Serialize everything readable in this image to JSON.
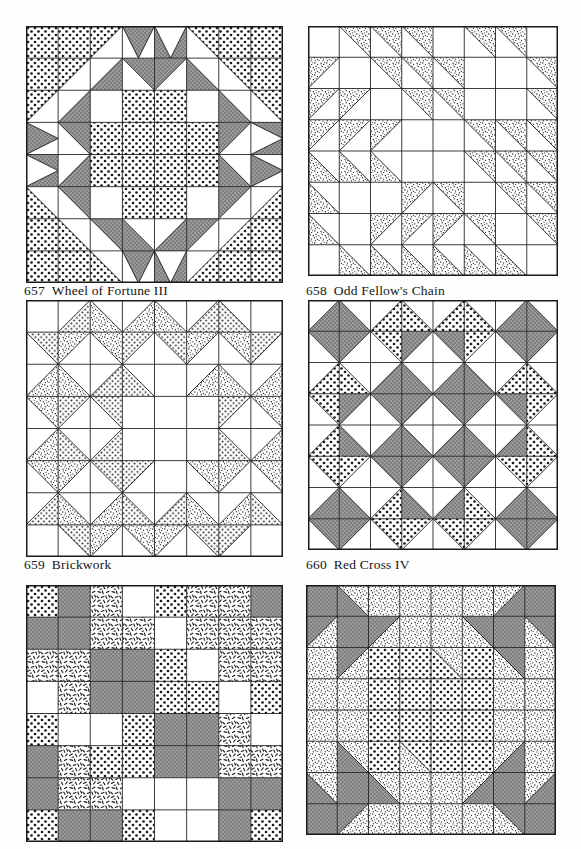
{
  "page": {
    "background": "#fefefe",
    "width": 581,
    "height": 849,
    "ink_color": "#1a1a1a"
  },
  "fabrics": {
    "white": {
      "name": "white-solid",
      "fill": "#ffffff",
      "swatch": "#ffffff"
    },
    "gray": {
      "name": "gray-solid",
      "fill": "#8d8d8d",
      "swatch": "#8d8d8d"
    },
    "coarse_dot": {
      "name": "coarse-dot-print",
      "fill": "#ffffff",
      "swatch": "#d8d8d8"
    },
    "fine_dot": {
      "name": "fine-dot-print",
      "fill": "#ffffff",
      "swatch": "#e8e8e8"
    },
    "speckle": {
      "name": "dense-speckle-print",
      "fill": "#ffffff",
      "swatch": "#9a9a9a"
    },
    "dash": {
      "name": "dash-stroke-print",
      "fill": "#ffffff",
      "swatch": "#f0f0f0"
    }
  },
  "blocks": [
    {
      "id": "block-657",
      "number": "657",
      "name": "Wheel of Fortune III",
      "grid": 8,
      "x": 26,
      "y": 26,
      "size": 257,
      "caption_x": 24,
      "caption_y": 283,
      "unit_type": "half-square-and-quarter-square",
      "cells": [
        [
          "D0",
          "D0",
          "hsq:tl:D0:W",
          "qst:v:G:W",
          "qst:v:W:G",
          "hsq:tr:D0:W",
          "D0",
          "D0"
        ],
        [
          "D0",
          "hsq:tl:D0:W",
          "hsq:br:G:W",
          "hsq:tr:G:W",
          "hsq:tl:G:W",
          "hsq:bl:G:W",
          "hsq:tr:D0:W",
          "D0"
        ],
        [
          "hsq:tl:D0:W",
          "hsq:br:G:W",
          "W",
          "D0",
          "D0",
          "W",
          "hsq:bl:G:W",
          "hsq:tr:D0:W"
        ],
        [
          "qst:h:G:W",
          "hsq:tr:G:W",
          "D0",
          "D0",
          "D0",
          "D0",
          "hsq:tl:G:W",
          "qst:h:W:G"
        ],
        [
          "qst:h:W:G",
          "hsq:br:G:W",
          "D0",
          "D0",
          "D0",
          "D0",
          "hsq:bl:G:W",
          "qst:h:G:W"
        ],
        [
          "hsq:bl:D0:W",
          "hsq:tr:G:W",
          "W",
          "D0",
          "D0",
          "W",
          "hsq:tl:G:W",
          "hsq:br:D0:W"
        ],
        [
          "D0",
          "hsq:bl:D0:W",
          "hsq:tr:G:W",
          "hsq:bl:G:W",
          "hsq:br:G:W",
          "hsq:tl:G:W",
          "hsq:br:D0:W",
          "D0"
        ],
        [
          "D0",
          "D0",
          "hsq:bl:D0:W",
          "qst:v:G:W",
          "qst:v:W:G",
          "hsq:br:D0:W",
          "D0",
          "D0"
        ]
      ]
    },
    {
      "id": "block-658",
      "number": "658",
      "name": "Odd Fellow's Chain",
      "grid": 8,
      "x": 308,
      "y": 26,
      "size": 250,
      "caption_x": 306,
      "caption_y": 283,
      "unit_type": "half-square-triangles",
      "cells": [
        [
          "W",
          "hsq:tr:S:W",
          "hsq:tr:S:W",
          "hsq:tr:S:W",
          "W",
          "hsq:tr:S:W",
          "hsq:tr:S:W",
          "W"
        ],
        [
          "hsq:tl:S:W",
          "W",
          "hsq:tr:S:W",
          "hsq:tr:S:W",
          "hsq:tr:S:W",
          "W",
          "W",
          "hsq:tr:S:W"
        ],
        [
          "hsq:tl:S:W",
          "hsq:tl:S:W",
          "W",
          "hsq:tr:S:W",
          "hsq:tr:S:W",
          "W",
          "W",
          "hsq:tr:S:W"
        ],
        [
          "hsq:tl:S:W",
          "hsq:tl:S:W",
          "hsq:tl:S:W",
          "W",
          "W",
          "hsq:tr:S:W",
          "hsq:tr:S:W",
          "hsq:tr:S:W"
        ],
        [
          "hsq:bl:S:W",
          "hsq:bl:S:W",
          "hsq:bl:S:W",
          "W",
          "W",
          "hsq:tr:S:W",
          "hsq:tr:S:W",
          "hsq:tr:S:W"
        ],
        [
          "hsq:bl:S:W",
          "W",
          "W",
          "hsq:tl:S:W",
          "hsq:tr:S:W",
          "W",
          "hsq:tr:S:W",
          "hsq:tr:S:W"
        ],
        [
          "hsq:bl:S:W",
          "W",
          "hsq:tl:S:W",
          "hsq:tl:S:W",
          "hsq:tl:S:W",
          "hsq:tr:S:W",
          "W",
          "hsq:tr:S:W"
        ],
        [
          "W",
          "hsq:bl:S:W",
          "hsq:bl:S:W",
          "hsq:bl:S:W",
          "hsq:bl:S:W",
          "hsq:bl:S:W",
          "hsq:bl:S:W",
          "W"
        ]
      ]
    },
    {
      "id": "block-659",
      "number": "659",
      "name": "Brickwork",
      "grid": 8,
      "x": 26,
      "y": 300,
      "size": 257,
      "caption_x": 24,
      "caption_y": 557,
      "unit_type": "quarter-square-triangles",
      "cells": [
        [
          "W",
          "hsq:br:D1:W",
          "hsq:bl:S:W",
          "hsq:br:S:W",
          "hsq:bl:S:W",
          "hsq:br:D1:W",
          "hsq:bl:D1:W",
          "W"
        ],
        [
          "hsq:tr:D1:W",
          "hsq:tl:S:W",
          "hsq:tr:S:W",
          "hsq:tl:D1:W",
          "hsq:tr:D1:W",
          "hsq:tl:S:W",
          "hsq:tr:S:W",
          "hsq:tl:D1:W"
        ],
        [
          "hsq:br:S:W",
          "hsq:bl:S:W",
          "hsq:br:D1:W",
          "hsq:bl:D1:W",
          "W",
          "hsq:br:S:W",
          "hsq:bl:S:W",
          "hsq:br:S:W"
        ],
        [
          "hsq:tr:S:W",
          "hsq:tl:D1:W",
          "hsq:tr:D1:W",
          "W",
          "W",
          "W",
          "hsq:tl:D1:W",
          "hsq:tr:S:W"
        ],
        [
          "hsq:br:S:W",
          "hsq:bl:D1:W",
          "hsq:br:D1:W",
          "W",
          "W",
          "W",
          "hsq:bl:D1:W",
          "hsq:br:S:W"
        ],
        [
          "hsq:tr:S:W",
          "hsq:tl:S:W",
          "hsq:tr:D1:W",
          "hsq:tl:D1:W",
          "W",
          "hsq:tr:S:W",
          "hsq:tl:S:W",
          "hsq:tr:S:W"
        ],
        [
          "hsq:br:D1:W",
          "hsq:bl:S:W",
          "hsq:br:S:W",
          "hsq:bl:D1:W",
          "hsq:br:D1:W",
          "hsq:bl:S:W",
          "hsq:br:S:W",
          "hsq:bl:D1:W"
        ],
        [
          "W",
          "hsq:tr:D1:W",
          "hsq:tl:S:W",
          "hsq:tr:S:W",
          "hsq:tl:S:W",
          "hsq:tr:D1:W",
          "hsq:tl:D1:W",
          "W"
        ]
      ]
    },
    {
      "id": "block-660",
      "number": "660",
      "name": "Red Cross IV",
      "grid": 8,
      "x": 308,
      "y": 300,
      "size": 250,
      "caption_x": 306,
      "caption_y": 557,
      "unit_type": "quarter-square-triangles",
      "cells": [
        [
          "hsq:br:G:W",
          "hsq:bl:G:W",
          "hsq:br:D0:W",
          "hsq:bl:D0:W",
          "hsq:br:D0:W",
          "hsq:bl:D0:W",
          "hsq:br:G:W",
          "hsq:bl:G:W"
        ],
        [
          "hsq:tr:G:W",
          "hsq:tl:G:W",
          "hsq:tr:D0:W",
          "hsq:tl:G:W",
          "hsq:tr:G:W",
          "hsq:tl:D0:W",
          "hsq:tr:G:W",
          "hsq:tl:G:W"
        ],
        [
          "hsq:br:D0:W",
          "hsq:bl:D0:W",
          "hsq:br:G:W",
          "hsq:bl:G:W",
          "hsq:br:G:W",
          "hsq:bl:G:W",
          "hsq:br:D0:W",
          "hsq:bl:D0:W"
        ],
        [
          "hsq:tr:D0:W",
          "hsq:tl:G:W",
          "hsq:tr:G:W",
          "hsq:tl:G:W",
          "hsq:tr:G:W",
          "hsq:tl:G:W",
          "hsq:tr:G:W",
          "hsq:tl:D0:W"
        ],
        [
          "hsq:br:D0:W",
          "hsq:bl:G:W",
          "hsq:br:G:W",
          "hsq:bl:G:W",
          "hsq:br:G:W",
          "hsq:bl:G:W",
          "hsq:br:G:W",
          "hsq:bl:D0:W"
        ],
        [
          "hsq:tr:D0:W",
          "hsq:tl:D0:W",
          "hsq:tr:G:W",
          "hsq:tl:G:W",
          "hsq:tr:G:W",
          "hsq:tl:G:W",
          "hsq:tr:D0:W",
          "hsq:tl:D0:W"
        ],
        [
          "hsq:br:G:W",
          "hsq:bl:G:W",
          "hsq:br:D0:W",
          "hsq:bl:G:W",
          "hsq:br:G:W",
          "hsq:bl:D0:W",
          "hsq:br:G:W",
          "hsq:bl:G:W"
        ],
        [
          "hsq:tr:G:W",
          "hsq:tl:G:W",
          "hsq:tr:D0:W",
          "hsq:tl:D0:W",
          "hsq:tr:D0:W",
          "hsq:tl:D0:W",
          "hsq:tr:G:W",
          "hsq:tl:G:W"
        ]
      ]
    },
    {
      "id": "block-661",
      "number": "",
      "name": "",
      "grid": 8,
      "x": 26,
      "y": 585,
      "size": 257,
      "caption_x": 24,
      "caption_y": 845,
      "unit_type": "plain-squares",
      "cells": [
        [
          "D0",
          "G",
          "DA",
          "W",
          "D0",
          "DA",
          "DA",
          "G"
        ],
        [
          "G",
          "G",
          "DA",
          "DA",
          "W",
          "DA",
          "DA",
          "DA"
        ],
        [
          "DA",
          "DA",
          "G",
          "G",
          "D0",
          "W",
          "DA",
          "DA"
        ],
        [
          "W",
          "DA",
          "G",
          "G",
          "D0",
          "D0",
          "W",
          "D0"
        ],
        [
          "D0",
          "W",
          "W",
          "D0",
          "G",
          "G",
          "DA",
          "W"
        ],
        [
          "G",
          "DA",
          "D0",
          "D0",
          "G",
          "G",
          "DA",
          "DA"
        ],
        [
          "G",
          "DA",
          "DA",
          "W",
          "W",
          "W",
          "G",
          "G"
        ],
        [
          "D0",
          "G",
          "G",
          "D0",
          "W",
          "W",
          "G",
          "D0"
        ]
      ]
    },
    {
      "id": "block-662",
      "number": "",
      "name": "",
      "grid": 8,
      "x": 306,
      "y": 585,
      "size": 250,
      "caption_x": 306,
      "caption_y": 845,
      "unit_type": "half-square-triangles-medallion",
      "cells": [
        [
          "G",
          "hsq:bl:G:S",
          "S",
          "S",
          "S",
          "S",
          "hsq:br:G:S",
          "G"
        ],
        [
          "hsq:tl:G:S",
          "G",
          "hsq:tl:G:S",
          "S",
          "S",
          "hsq:tr:G:S",
          "G",
          "hsq:tr:G:S"
        ],
        [
          "S",
          "hsq:tl:G:S",
          "D0",
          "D0",
          "hsq:tr:S:D0",
          "D0",
          "hsq:tr:G:S",
          "S"
        ],
        [
          "S",
          "S",
          "D0",
          "D0",
          "D0",
          "D0",
          "S",
          "S"
        ],
        [
          "S",
          "S",
          "D0",
          "D0",
          "D0",
          "D0",
          "S",
          "S"
        ],
        [
          "S",
          "hsq:bl:G:S",
          "D0",
          "hsq:bl:S:D0",
          "D0",
          "D0",
          "hsq:br:G:S",
          "S"
        ],
        [
          "hsq:bl:G:S",
          "G",
          "hsq:bl:G:S",
          "S",
          "S",
          "hsq:br:G:S",
          "G",
          "hsq:br:G:S"
        ],
        [
          "G",
          "hsq:tl:G:S",
          "S",
          "S",
          "S",
          "S",
          "hsq:tr:G:S",
          "G"
        ]
      ]
    }
  ],
  "captions": [
    {
      "number": "657",
      "name": "Wheel of Fortune III"
    },
    {
      "number": "658",
      "name": "Odd Fellow's Chain"
    },
    {
      "number": "659",
      "name": "Brickwork"
    },
    {
      "number": "660",
      "name": "Red Cross IV"
    }
  ]
}
